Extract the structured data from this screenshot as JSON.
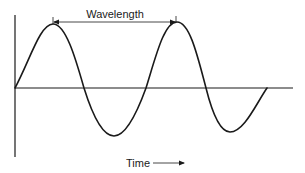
{
  "diagram": {
    "labels": {
      "wavelength": "Wavelength",
      "time": "Time"
    },
    "colors": {
      "line": "#1a1a1a",
      "background": "#ffffff"
    },
    "wave": {
      "type": "sine",
      "start_at_origin": true,
      "peaks": 2,
      "troughs": 2,
      "ends_at_zero_after_second_trough": true
    },
    "annotations": [
      {
        "type": "double-arrow",
        "label": "Wavelength",
        "from": "first peak",
        "to": "second peak"
      },
      {
        "type": "arrow",
        "label": "Time",
        "direction": "right"
      }
    ]
  }
}
